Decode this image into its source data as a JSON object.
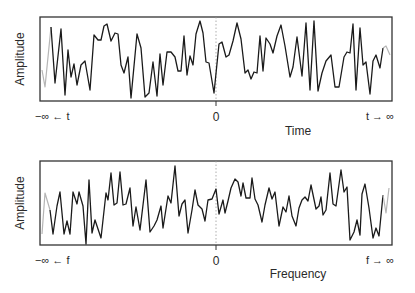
{
  "chart_data": [
    {
      "type": "line",
      "title": "",
      "xlabel": "Time",
      "ylabel": "Amplitude",
      "tick_labels": {
        "left": "−∞ ← t",
        "center": "0",
        "right": "t → ∞"
      },
      "grid": false,
      "zero_marker": "dotted vertical line at 0",
      "series": [
        {
          "name": "signal (time domain)",
          "color": "#1a1a1a",
          "faded_ends_color": "#b0b0b0",
          "points": [
            [
              42,
              70
            ],
            [
              45,
              87
            ],
            [
              51,
              27
            ],
            [
              55,
              83
            ],
            [
              61,
              29
            ],
            [
              65,
              95
            ],
            [
              68,
              50
            ],
            [
              71,
              77
            ],
            [
              74,
              64
            ],
            [
              77,
              85
            ],
            [
              81,
              65
            ],
            [
              85,
              61
            ],
            [
              90,
              90
            ],
            [
              94,
              35
            ],
            [
              98,
              40
            ],
            [
              101,
              40
            ],
            [
              104,
              26
            ],
            [
              107,
              24
            ],
            [
              111,
              41
            ],
            [
              115,
              33
            ],
            [
              118,
              34
            ],
            [
              121,
              65
            ],
            [
              124,
              73
            ],
            [
              128,
              57
            ],
            [
              131,
              98
            ],
            [
              137,
              34
            ],
            [
              141,
              48
            ],
            [
              145,
              97
            ],
            [
              149,
              93
            ],
            [
              153,
              62
            ],
            [
              157,
              96
            ],
            [
              160,
              54
            ],
            [
              163,
              85
            ],
            [
              167,
              52
            ],
            [
              171,
              52
            ],
            [
              175,
              57
            ],
            [
              178,
              71
            ],
            [
              181,
              71
            ],
            [
              184,
              36
            ],
            [
              187,
              75
            ],
            [
              190,
              56
            ],
            [
              193,
              65
            ],
            [
              196,
              34
            ],
            [
              200,
              21
            ],
            [
              203,
              33
            ],
            [
              206,
              62
            ],
            [
              209,
              63
            ],
            [
              214,
              93
            ],
            [
              219,
              44
            ],
            [
              222,
              42
            ],
            [
              226,
              57
            ],
            [
              229,
              55
            ],
            [
              233,
              41
            ],
            [
              237,
              23
            ],
            [
              241,
              39
            ],
            [
              245,
              73
            ],
            [
              248,
              70
            ],
            [
              251,
              79
            ],
            [
              254,
              72
            ],
            [
              257,
              73
            ],
            [
              260,
              36
            ],
            [
              263,
              71
            ],
            [
              266,
              38
            ],
            [
              270,
              44
            ],
            [
              273,
              53
            ],
            [
              277,
              36
            ],
            [
              281,
              25
            ],
            [
              285,
              46
            ],
            [
              290,
              77
            ],
            [
              293,
              67
            ],
            [
              297,
              37
            ],
            [
              302,
              76
            ],
            [
              306,
              23
            ],
            [
              310,
              90
            ],
            [
              314,
              21
            ],
            [
              318,
              91
            ],
            [
              322,
              73
            ],
            [
              326,
              61
            ],
            [
              331,
              55
            ],
            [
              335,
              87
            ],
            [
              339,
              87
            ],
            [
              344,
              57
            ],
            [
              347,
              52
            ],
            [
              350,
              53
            ],
            [
              353,
              24
            ],
            [
              356,
              90
            ],
            [
              360,
              28
            ],
            [
              363,
              65
            ],
            [
              366,
              62
            ],
            [
              370,
              94
            ],
            [
              373,
              61
            ],
            [
              376,
              55
            ],
            [
              380,
              68
            ],
            [
              383,
              48
            ],
            [
              386,
              46
            ],
            [
              390,
              55
            ]
          ]
        }
      ]
    },
    {
      "type": "line",
      "title": "",
      "xlabel": "Frequency",
      "ylabel": "Amplitude",
      "tick_labels": {
        "left": "−∞ ← f",
        "center": "0",
        "right": "f → ∞"
      },
      "grid": false,
      "zero_marker": "dotted vertical line at 0",
      "series": [
        {
          "name": "spectrum (frequency domain)",
          "color": "#1a1a1a",
          "faded_ends_color": "#b0b0b0",
          "points": [
            [
              42,
              234
            ],
            [
              45,
              193
            ],
            [
              50,
              210
            ],
            [
              53,
              234
            ],
            [
              57,
              206
            ],
            [
              60,
              192
            ],
            [
              64,
              234
            ],
            [
              67,
              221
            ],
            [
              70,
              234
            ],
            [
              73,
              192
            ],
            [
              77,
              204
            ],
            [
              79,
              192
            ],
            [
              83,
              206
            ],
            [
              86,
              244
            ],
            [
              89,
              180
            ],
            [
              92,
              233
            ],
            [
              95,
              220
            ],
            [
              101,
              238
            ],
            [
              106,
              193
            ],
            [
              108,
              200
            ],
            [
              111,
              173
            ],
            [
              114,
              205
            ],
            [
              117,
              203
            ],
            [
              120,
              172
            ],
            [
              123,
              205
            ],
            [
              126,
              204
            ],
            [
              130,
              188
            ],
            [
              133,
              226
            ],
            [
              136,
              207
            ],
            [
              140,
              230
            ],
            [
              146,
              180
            ],
            [
              150,
              232
            ],
            [
              154,
              226
            ],
            [
              157,
              220
            ],
            [
              161,
              206
            ],
            [
              163,
              228
            ],
            [
              168,
              196
            ],
            [
              171,
              203
            ],
            [
              175,
              166
            ],
            [
              179,
              216
            ],
            [
              182,
              204
            ],
            [
              185,
              200
            ],
            [
              188,
              233
            ],
            [
              192,
              210
            ],
            [
              195,
              190
            ],
            [
              198,
              205
            ],
            [
              202,
              209
            ],
            [
              205,
              221
            ],
            [
              208,
              200
            ],
            [
              212,
              199
            ],
            [
              216,
              189
            ],
            [
              219,
              214
            ],
            [
              223,
              200
            ],
            [
              225,
              213
            ],
            [
              228,
              201
            ],
            [
              231,
              188
            ],
            [
              235,
              179
            ],
            [
              238,
              182
            ],
            [
              241,
              196
            ],
            [
              243,
              183
            ],
            [
              246,
              198
            ],
            [
              250,
              198
            ],
            [
              252,
              178
            ],
            [
              255,
              199
            ],
            [
              258,
              205
            ],
            [
              262,
              222
            ],
            [
              265,
              205
            ],
            [
              269,
              188
            ],
            [
              272,
              199
            ],
            [
              275,
              192
            ],
            [
              279,
              226
            ],
            [
              283,
              207
            ],
            [
              286,
              212
            ],
            [
              289,
              196
            ],
            [
              292,
              216
            ],
            [
              296,
              226
            ],
            [
              299,
              208
            ],
            [
              302,
              200
            ],
            [
              305,
              197
            ],
            [
              308,
              201
            ],
            [
              311,
              185
            ],
            [
              316,
              209
            ],
            [
              319,
              206
            ],
            [
              321,
              197
            ],
            [
              323,
              215
            ],
            [
              326,
              210
            ],
            [
              330,
              173
            ],
            [
              333,
              204
            ],
            [
              336,
              206
            ],
            [
              341,
              170
            ],
            [
              344,
              192
            ],
            [
              347,
              187
            ],
            [
              350,
              240
            ],
            [
              354,
              232
            ],
            [
              357,
              220
            ],
            [
              360,
              235
            ],
            [
              362,
              194
            ],
            [
              365,
              184
            ],
            [
              369,
              208
            ],
            [
              373,
              238
            ],
            [
              376,
              228
            ],
            [
              379,
              236
            ],
            [
              383,
              195
            ],
            [
              386,
              213
            ],
            [
              389,
              188
            ]
          ]
        }
      ]
    }
  ],
  "top_panel": {
    "ylabel": "Amplitude",
    "xlabel": "Time",
    "left_tick": "−∞ ← t",
    "zero_tick": "0",
    "right_tick": "t → ∞"
  },
  "bottom_panel": {
    "ylabel": "Amplitude",
    "xlabel": "Frequency",
    "left_tick": "−∞ ← f",
    "zero_tick": "0",
    "right_tick": "f → ∞"
  }
}
